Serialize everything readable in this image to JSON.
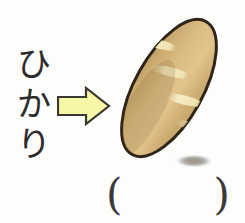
{
  "card": {
    "background_color": "#fdfdfc",
    "type": "vocabulary-picture-card"
  },
  "word": {
    "reading": "ひかり",
    "orientation": "vertical",
    "characters": [
      "ひ",
      "か",
      "り"
    ],
    "color": "#2e2c2b"
  },
  "arrow": {
    "icon": "arrow-right-icon",
    "direction": "right",
    "fill_color": "#f7f7a8",
    "stroke_color": "#3a3830"
  },
  "illustration": {
    "icon": "bread-icon",
    "subject": "french-bread",
    "orientation": "diagonal",
    "outline_color": "#2e2418",
    "crust_light_color": "#e8c98a",
    "crust_mid_color": "#d9b878",
    "crust_dark_color": "#b4935b",
    "score_mark_color": "#f6edbe",
    "score_mark_count": 4,
    "shadow_color": "#9c8a6a"
  },
  "answer_blank": {
    "left_paren": "(",
    "right_paren": ")",
    "value": "",
    "color": "#3b3a39"
  }
}
